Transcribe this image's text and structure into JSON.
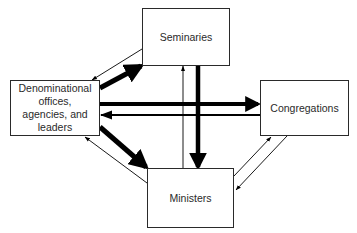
{
  "diagram": {
    "nodes": [
      {
        "id": "seminaries",
        "label": "Seminaries"
      },
      {
        "id": "denominational",
        "label": "Denominational offices, agencies, and leaders",
        "lines": [
          "Denominational",
          "offices,",
          "agencies, and",
          "leaders"
        ]
      },
      {
        "id": "congregations",
        "label": "Congregations"
      },
      {
        "id": "ministers",
        "label": "Ministers"
      }
    ],
    "edges": [
      {
        "from": "denominational",
        "to": "seminaries",
        "weight": "thick"
      },
      {
        "from": "seminaries",
        "to": "denominational",
        "weight": "thin"
      },
      {
        "from": "denominational",
        "to": "congregations",
        "weight": "thick"
      },
      {
        "from": "congregations",
        "to": "denominational",
        "weight": "thin"
      },
      {
        "from": "seminaries",
        "to": "ministers",
        "weight": "thick"
      },
      {
        "from": "ministers",
        "to": "seminaries",
        "weight": "thin"
      },
      {
        "from": "denominational",
        "to": "ministers",
        "weight": "thick"
      },
      {
        "from": "ministers",
        "to": "denominational",
        "weight": "thin"
      },
      {
        "from": "ministers",
        "to": "congregations",
        "weight": "thin"
      },
      {
        "from": "congregations",
        "to": "ministers",
        "weight": "thin"
      }
    ],
    "colors": {
      "stroke": "#000000",
      "box_border": "#2a2a2a",
      "text": "#2a2a2a",
      "background": "#ffffff"
    }
  }
}
